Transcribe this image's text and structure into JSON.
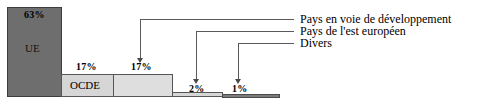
{
  "chart_data": {
    "type": "bar",
    "title": "",
    "subtitle": "",
    "xlabel": "",
    "ylabel": "",
    "ylim": [
      0,
      63
    ],
    "grid": false,
    "legend_position": "right",
    "categories": [
      "UE",
      "OCDE",
      "Pays en voie de développement",
      "Pays de l'est européen",
      "Divers"
    ],
    "values": [
      63,
      17,
      17,
      2,
      1
    ],
    "value_labels": [
      "63%",
      "17%",
      "17%",
      "2%",
      "1%"
    ],
    "series": [
      {
        "name": "Répartition",
        "values": [
          63,
          17,
          17,
          2,
          1
        ]
      }
    ],
    "annotations": [
      "Pays en voie de développement",
      "Pays de l'est européen",
      "Divers"
    ]
  },
  "bars": {
    "ue": {
      "percent_label": "63%",
      "name_label": "UE",
      "color": "#6e6e6e"
    },
    "ocde": {
      "percent_label": "17%",
      "name_label": "OCDE",
      "color": "#d6d6d6"
    },
    "dev": {
      "percent_label": "17%",
      "name_label": "",
      "color": "#dedede"
    },
    "est": {
      "percent_label": "2%",
      "name_label": "",
      "color": "#d6d6d6"
    },
    "divers": {
      "percent_label": "1%",
      "name_label": "",
      "color": "#7c7c7c"
    }
  },
  "legend": {
    "items": [
      {
        "label": "Pays en voie de développement"
      },
      {
        "label": "Pays de l'est européen"
      },
      {
        "label": "Divers"
      }
    ]
  },
  "colors": {
    "bar_dark": "#6e6e6e",
    "bar_light": "#d6d6d6",
    "bar_lighter": "#dedede",
    "bar_divers": "#7c7c7c",
    "outline": "#555555",
    "leader": "#5a5a5a",
    "text": "#000000",
    "background": "#ffffff"
  }
}
